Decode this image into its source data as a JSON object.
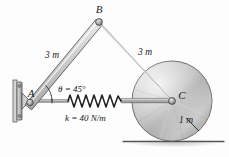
{
  "figure": {
    "background_color": "#fdfdfd",
    "ground_color": "#555555"
  },
  "labels": {
    "point_a": "A",
    "point_b": "B",
    "point_c": "C",
    "link_ab_length": "3 m",
    "link_bc_length": "3 m",
    "angle": "θ = 45°",
    "spring_constant": "k = 40 N/m",
    "disk_radius": "1 m"
  },
  "geometry": {
    "a": {
      "x": 27,
      "y": 101
    },
    "b": {
      "x": 99,
      "y": 22
    },
    "c": {
      "x": 172,
      "y": 101
    },
    "disk_center": {
      "x": 172,
      "y": 101
    },
    "disk_radius_px": 40,
    "ground_y": 141,
    "ground_x1": 123,
    "ground_x2": 224,
    "spring_x1": 68,
    "spring_x2": 122,
    "spring_coils": 9,
    "angle_arc_radius": 22
  },
  "colors": {
    "link_fill_light": "#f2f2f2",
    "link_fill_mid": "#c9c9c9",
    "link_fill_dark": "#9a9a9a",
    "link_stroke": "#4a4a4a",
    "disk_light": "#efefef",
    "disk_mid": "#c2c2c2",
    "disk_dark": "#8e8e8e",
    "disk_stroke": "#5a5a5a",
    "wall_fill": "#bdbdbd",
    "wall_stroke": "#4a4a4a",
    "spring_stroke": "#1f1f1f",
    "rod_fill": "#a8a8a8",
    "text": "#1b1b1b"
  }
}
